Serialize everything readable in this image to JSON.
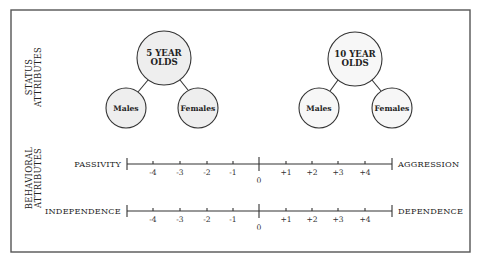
{
  "side_labels": {
    "status": [
      "STATUS",
      "ATTRIBUTES"
    ],
    "behavioral": [
      "BEHAVIORAL",
      "ATTRIBUTES"
    ]
  },
  "groups": [
    {
      "title_lines": [
        "5 YEAR",
        "OLDS"
      ],
      "children": [
        "Males",
        "Females"
      ]
    },
    {
      "title_lines": [
        "10 YEAR",
        "OLDS"
      ],
      "children": [
        "Males",
        "Females"
      ]
    }
  ],
  "scales": [
    {
      "left": "PASSIVITY",
      "right": "AGGRESSION"
    },
    {
      "left": "INDEPENDENCE",
      "right": "DEPENDENCE"
    }
  ],
  "tick_labels": [
    "-4",
    "-3",
    "-2",
    "-1",
    "0",
    "+1",
    "+2",
    "+3",
    "+4"
  ]
}
